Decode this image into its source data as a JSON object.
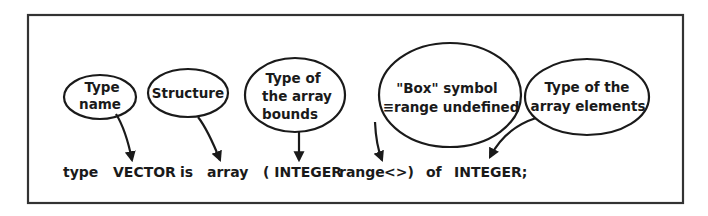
{
  "diagram": {
    "callouts": [
      {
        "id": "type-name",
        "lines": [
          "Type",
          "name"
        ]
      },
      {
        "id": "structure",
        "lines": [
          "Structure"
        ]
      },
      {
        "id": "bounds-type",
        "lines": [
          "Type of",
          "the array",
          "bounds"
        ]
      },
      {
        "id": "box-symbol",
        "lines": [
          "\"Box\" symbol",
          "≡range undefined"
        ]
      },
      {
        "id": "element-type",
        "lines": [
          "Type of the",
          "array elements"
        ]
      }
    ],
    "code_tokens": [
      "type",
      "VECTOR",
      "is",
      "array",
      "( INTEGER",
      "range",
      "<>)",
      "of",
      "INTEGER;"
    ]
  }
}
